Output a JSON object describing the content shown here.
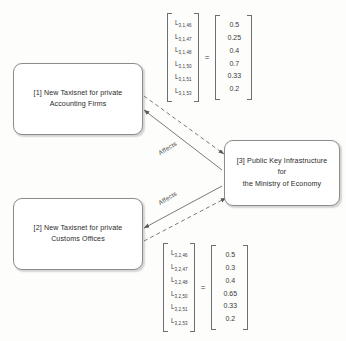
{
  "diagram": {
    "nodes": [
      {
        "id": "1",
        "label": "[1] New Taxisnet for private\nAccounting Firms"
      },
      {
        "id": "2",
        "label": "[2] New Taxisnet for private\nCustoms Offices"
      },
      {
        "id": "3",
        "label": "[3] Public Key Infrastructure for\nthe Ministry of Economy"
      }
    ],
    "edges": [
      {
        "from": "3",
        "to": "1",
        "label": "Affects",
        "style": "solid"
      },
      {
        "from": "1",
        "to": "3",
        "label": "",
        "style": "dashed"
      },
      {
        "from": "3",
        "to": "2",
        "label": "Affects",
        "style": "solid"
      },
      {
        "from": "2",
        "to": "3",
        "label": "",
        "style": "dashed"
      }
    ],
    "matrices": [
      {
        "id": "matrix-top",
        "equals": "=",
        "rows": [
          {
            "symbol": "L",
            "subscript": "3,1,46",
            "value": "0.5"
          },
          {
            "symbol": "L",
            "subscript": "3,1,47",
            "value": "0.25"
          },
          {
            "symbol": "L",
            "subscript": "3,1,48",
            "value": "0.4"
          },
          {
            "symbol": "L",
            "subscript": "3,1,50",
            "value": "0.7"
          },
          {
            "symbol": "L",
            "subscript": "3,1,51",
            "value": "0.33"
          },
          {
            "symbol": "L",
            "subscript": "3,1,53",
            "value": "0.2"
          }
        ]
      },
      {
        "id": "matrix-bottom",
        "equals": "=",
        "rows": [
          {
            "symbol": "L",
            "subscript": "3,2,46",
            "value": "0.5"
          },
          {
            "symbol": "L",
            "subscript": "3,2,47",
            "value": "0.3"
          },
          {
            "symbol": "L",
            "subscript": "3,2,48",
            "value": "0.4"
          },
          {
            "symbol": "L",
            "subscript": "3,2,50",
            "value": "0.65"
          },
          {
            "symbol": "L",
            "subscript": "3,2,51",
            "value": "0.33"
          },
          {
            "symbol": "L",
            "subscript": "3,2,53",
            "value": "0.2"
          }
        ]
      }
    ],
    "colors": {
      "stroke": "#8c8c8c",
      "text": "#2a2a2a",
      "background": "#fdfdfc"
    }
  }
}
